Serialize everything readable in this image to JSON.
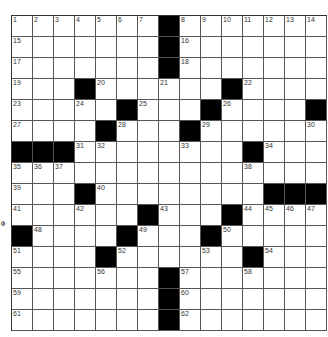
{
  "puzzle": {
    "rows": 15,
    "cols": 15,
    "colors": {
      "block": "#000000",
      "cell": "#ffffff",
      "line": "#555555"
    },
    "blocks": [
      [
        0,
        7
      ],
      [
        1,
        7
      ],
      [
        2,
        7
      ],
      [
        3,
        3
      ],
      [
        3,
        10
      ],
      [
        4,
        5
      ],
      [
        4,
        9
      ],
      [
        4,
        14
      ],
      [
        5,
        4
      ],
      [
        5,
        8
      ],
      [
        6,
        0
      ],
      [
        6,
        1
      ],
      [
        6,
        2
      ],
      [
        6,
        11
      ],
      [
        8,
        3
      ],
      [
        8,
        12
      ],
      [
        8,
        13
      ],
      [
        8,
        14
      ],
      [
        9,
        6
      ],
      [
        9,
        10
      ],
      [
        10,
        0
      ],
      [
        10,
        5
      ],
      [
        10,
        9
      ],
      [
        11,
        4
      ],
      [
        11,
        11
      ],
      [
        12,
        7
      ],
      [
        13,
        7
      ],
      [
        14,
        7
      ]
    ],
    "numbers": [
      [
        0,
        0,
        "1"
      ],
      [
        0,
        1,
        "2"
      ],
      [
        0,
        2,
        "3"
      ],
      [
        0,
        3,
        "4"
      ],
      [
        0,
        4,
        "5"
      ],
      [
        0,
        5,
        "6"
      ],
      [
        0,
        6,
        "7"
      ],
      [
        0,
        8,
        "8"
      ],
      [
        0,
        9,
        "9"
      ],
      [
        0,
        10,
        "10"
      ],
      [
        0,
        11,
        "11"
      ],
      [
        0,
        12,
        "12"
      ],
      [
        0,
        13,
        "13"
      ],
      [
        0,
        14,
        "14"
      ],
      [
        1,
        0,
        "15"
      ],
      [
        1,
        8,
        "16"
      ],
      [
        2,
        0,
        "17"
      ],
      [
        2,
        8,
        "18"
      ],
      [
        3,
        0,
        "19"
      ],
      [
        3,
        4,
        "20"
      ],
      [
        3,
        7,
        "21"
      ],
      [
        3,
        11,
        "22"
      ],
      [
        4,
        0,
        "23"
      ],
      [
        4,
        3,
        "24"
      ],
      [
        4,
        6,
        "25"
      ],
      [
        4,
        10,
        "26"
      ],
      [
        5,
        0,
        "27"
      ],
      [
        5,
        5,
        "28"
      ],
      [
        5,
        9,
        "29"
      ],
      [
        5,
        14,
        "30"
      ],
      [
        6,
        3,
        "31"
      ],
      [
        6,
        4,
        "32"
      ],
      [
        6,
        8,
        "33"
      ],
      [
        6,
        12,
        "34"
      ],
      [
        7,
        0,
        "35"
      ],
      [
        7,
        1,
        "36"
      ],
      [
        7,
        2,
        "37"
      ],
      [
        7,
        11,
        "38"
      ],
      [
        8,
        0,
        "39"
      ],
      [
        8,
        4,
        "40"
      ],
      [
        9,
        0,
        "41"
      ],
      [
        9,
        3,
        "42"
      ],
      [
        9,
        7,
        "43"
      ],
      [
        9,
        11,
        "44"
      ],
      [
        9,
        12,
        "45"
      ],
      [
        9,
        13,
        "46"
      ],
      [
        9,
        14,
        "47"
      ],
      [
        10,
        1,
        "48"
      ],
      [
        10,
        6,
        "49"
      ],
      [
        10,
        10,
        "50"
      ],
      [
        11,
        0,
        "51"
      ],
      [
        11,
        5,
        "52"
      ],
      [
        11,
        9,
        "53"
      ],
      [
        11,
        12,
        "54"
      ],
      [
        12,
        0,
        "55"
      ],
      [
        12,
        4,
        "56"
      ],
      [
        12,
        8,
        "57"
      ],
      [
        12,
        11,
        "58"
      ],
      [
        13,
        0,
        "59"
      ],
      [
        13,
        8,
        "60"
      ],
      [
        14,
        0,
        "61"
      ],
      [
        14,
        8,
        "62"
      ]
    ]
  },
  "margin_mark": "ⴱ"
}
